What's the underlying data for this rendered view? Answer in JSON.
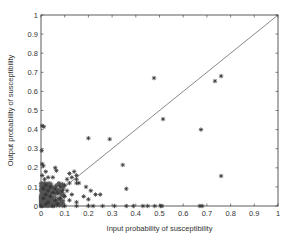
{
  "chart_data": {
    "type": "scatter",
    "title": "",
    "xlabel": "Input probability of susceptibility",
    "ylabel": "Output probability of susceptibility",
    "xlim": [
      0,
      1
    ],
    "ylim": [
      0,
      1
    ],
    "xticks": [
      "0",
      "0.1",
      "0.2",
      "0.3",
      "0.4",
      "0.5",
      "0.6",
      "0.7",
      "0.8",
      "0.9",
      "1"
    ],
    "yticks": [
      "0",
      "0.1",
      "0.2",
      "0.3",
      "0.4",
      "0.5",
      "0.6",
      "0.7",
      "0.8",
      "0.9",
      "1"
    ],
    "grid": false,
    "legend": null,
    "marker": "asterisk",
    "marker_color": "#333333",
    "reference_line": {
      "label": "y = x",
      "from": [
        0,
        0
      ],
      "to": [
        1,
        1
      ],
      "color": "#555555"
    },
    "series": [
      {
        "name": "samples",
        "points": [
          [
            0.477,
            0.67
          ],
          [
            0.515,
            0.455
          ],
          [
            0.734,
            0.654
          ],
          [
            0.76,
            0.68
          ],
          [
            0.675,
            0.4
          ],
          [
            0.76,
            0.157
          ],
          [
            0.2,
            0.355
          ],
          [
            0.29,
            0.35
          ],
          [
            0.345,
            0.215
          ],
          [
            0.36,
            0.09
          ],
          [
            0.005,
            0.42
          ],
          [
            0.012,
            0.415
          ],
          [
            0.003,
            0.29
          ],
          [
            0.005,
            0.22
          ],
          [
            0.01,
            0.21
          ],
          [
            0.02,
            0.18
          ],
          [
            0.005,
            0.16
          ],
          [
            0.03,
            0.15
          ],
          [
            0.015,
            0.14
          ],
          [
            0.06,
            0.2
          ],
          [
            0.065,
            0.185
          ],
          [
            0.12,
            0.17
          ],
          [
            0.14,
            0.18
          ],
          [
            0.15,
            0.16
          ],
          [
            0.13,
            0.15
          ],
          [
            0.11,
            0.14
          ],
          [
            0.15,
            0.14
          ],
          [
            0.15,
            0.12
          ],
          [
            0.12,
            0.12
          ],
          [
            0.1,
            0.11
          ],
          [
            0.08,
            0.1
          ],
          [
            0.06,
            0.09
          ],
          [
            0.09,
            0.08
          ],
          [
            0.11,
            0.08
          ],
          [
            0.07,
            0.07
          ],
          [
            0.13,
            0.06
          ],
          [
            0.05,
            0.15
          ],
          [
            0.19,
            0.1
          ],
          [
            0.21,
            0.08
          ],
          [
            0.18,
            0.05
          ],
          [
            0.23,
            0.06
          ],
          [
            0.2,
            0.035
          ],
          [
            0.25,
            0.06
          ],
          [
            0.16,
            0.12
          ],
          [
            0.1,
            0.05
          ],
          [
            0.08,
            0.04
          ],
          [
            0.12,
            0.03
          ],
          [
            0.15,
            0.02
          ],
          [
            0.02,
            0.11
          ],
          [
            0.04,
            0.1
          ],
          [
            0.01,
            0.09
          ],
          [
            0.03,
            0.08
          ],
          [
            0.05,
            0.07
          ],
          [
            0.02,
            0.06
          ],
          [
            0.04,
            0.05
          ],
          [
            0.01,
            0.04
          ],
          [
            0.06,
            0.03
          ],
          [
            0.03,
            0.02
          ],
          [
            0.02,
            0.01
          ],
          [
            0.07,
            0.01
          ],
          [
            0.0,
            0.0
          ],
          [
            0.05,
            0.0
          ],
          [
            0.1,
            0.0
          ],
          [
            0.15,
            0.0
          ],
          [
            0.2,
            0.0
          ],
          [
            0.22,
            0.0
          ],
          [
            0.26,
            0.0
          ],
          [
            0.31,
            0.0
          ],
          [
            0.36,
            0.0
          ],
          [
            0.39,
            0.0
          ],
          [
            0.43,
            0.0
          ],
          [
            0.45,
            0.0
          ],
          [
            0.48,
            0.0
          ],
          [
            0.505,
            0.0
          ],
          [
            0.51,
            0.0
          ],
          [
            0.67,
            0.0
          ],
          [
            0.68,
            0.0
          ]
        ],
        "dense_cluster": {
          "x_range": [
            0,
            0.1
          ],
          "y_range": [
            0,
            0.12
          ],
          "description": "dense mass of overlapping points near origin"
        }
      }
    ]
  }
}
